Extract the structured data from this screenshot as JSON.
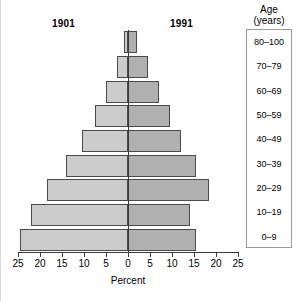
{
  "figure": {
    "era_left_label": "1901",
    "era_right_label": "1991",
    "legend_title_line1": "Age",
    "legend_title_line2": "(years)",
    "x_title": "Percent"
  },
  "axis": {
    "tick_labels": [
      "25",
      "20",
      "15",
      "10",
      "5",
      "0",
      "5",
      "10",
      "15",
      "20",
      "25"
    ],
    "tick_values": [
      -25,
      -20,
      -15,
      -10,
      -5,
      0,
      5,
      10,
      15,
      20,
      25
    ]
  },
  "colors": {
    "bar_1901": "#cccccc",
    "bar_1991": "#b0b0b0",
    "bar_stroke": "#4a4a4a",
    "axis": "#3a3a3a",
    "legend_border": "#9a9a9a",
    "background": "#ffffff"
  },
  "chart_data": {
    "type": "bar",
    "title": "",
    "subtitle": "",
    "xlabel": "Percent",
    "ylabel": "Age (years)",
    "xlim": [
      -25,
      25
    ],
    "grid": false,
    "legend_position": "top",
    "orientation": "population-pyramid",
    "categories": [
      "0–9",
      "10–19",
      "20–29",
      "30–39",
      "40–49",
      "50–59",
      "60–69",
      "70–79",
      "80–100"
    ],
    "series": [
      {
        "name": "1901",
        "side": "left",
        "color": "#cccccc",
        "values": [
          24.5,
          22.0,
          18.5,
          14.0,
          10.5,
          7.5,
          5.0,
          2.5,
          0.8
        ]
      },
      {
        "name": "1991",
        "side": "right",
        "color": "#b0b0b0",
        "values": [
          15.5,
          14.0,
          18.5,
          15.5,
          12.0,
          9.5,
          7.0,
          4.5,
          2.0
        ]
      }
    ]
  }
}
